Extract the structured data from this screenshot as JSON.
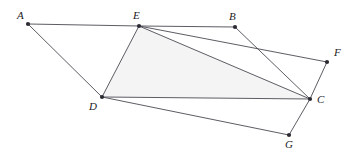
{
  "figure": {
    "type": "geometry-diagram",
    "width": 360,
    "height": 158,
    "background_color": "#ffffff",
    "stroke_color": "#4a4a52",
    "stroke_width": 0.9,
    "vertex_dot_color": "#2b2b33",
    "vertex_dot_radius": 2.1,
    "shaded_region_fill": "#f4f4f5",
    "label_color": "#1b1b1b",
    "points": [
      {
        "id": "A",
        "label": "A",
        "x": 28,
        "y": 24,
        "label_x": 17,
        "label_y": 10
      },
      {
        "id": "E",
        "label": "E",
        "x": 139,
        "y": 26,
        "label_x": 133,
        "label_y": 10
      },
      {
        "id": "B",
        "label": "B",
        "x": 235,
        "y": 27,
        "label_x": 229,
        "label_y": 11
      },
      {
        "id": "F",
        "label": "F",
        "x": 327,
        "y": 62,
        "label_x": 334,
        "label_y": 47
      },
      {
        "id": "C",
        "label": "C",
        "x": 310,
        "y": 99,
        "label_x": 317,
        "label_y": 94
      },
      {
        "id": "D",
        "label": "D",
        "x": 102,
        "y": 97,
        "label_x": 89,
        "label_y": 101
      },
      {
        "id": "G",
        "label": "G",
        "x": 289,
        "y": 135,
        "label_x": 285,
        "label_y": 139
      }
    ],
    "edges": [
      {
        "id": "A-E",
        "from": "A",
        "to": "E"
      },
      {
        "id": "A-D",
        "from": "A",
        "to": "D"
      },
      {
        "id": "E-D",
        "from": "E",
        "to": "D"
      },
      {
        "id": "E-B",
        "from": "E",
        "to": "B"
      },
      {
        "id": "E-F",
        "from": "E",
        "to": "F"
      },
      {
        "id": "E-C",
        "from": "E",
        "to": "C"
      },
      {
        "id": "B-C",
        "from": "B",
        "to": "C"
      },
      {
        "id": "F-C",
        "from": "F",
        "to": "C"
      },
      {
        "id": "D-C",
        "from": "D",
        "to": "C"
      },
      {
        "id": "D-G",
        "from": "D",
        "to": "G"
      },
      {
        "id": "C-G",
        "from": "C",
        "to": "G"
      }
    ],
    "shaded_regions": [
      {
        "id": "region-EDC",
        "vertices": [
          "E",
          "D",
          "C"
        ]
      }
    ],
    "watermark": {
      "line1": "",
      "line2": "",
      "x": 150,
      "y": 58
    }
  }
}
